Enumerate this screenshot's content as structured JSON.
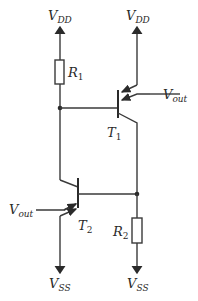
{
  "diagram": {
    "type": "circuit-schematic",
    "supplies": {
      "vdd_left": {
        "main": "V",
        "sub": "DD"
      },
      "vdd_right": {
        "main": "V",
        "sub": "DD"
      },
      "vss_left": {
        "main": "V",
        "sub": "SS"
      },
      "vss_right": {
        "main": "V",
        "sub": "SS"
      }
    },
    "resistors": [
      {
        "id": "R1",
        "main": "R",
        "sub": "1"
      },
      {
        "id": "R2",
        "main": "R",
        "sub": "2"
      }
    ],
    "transistors": [
      {
        "id": "T1",
        "main": "T",
        "sub": "1",
        "type": "multi-emitter PNP"
      },
      {
        "id": "T2",
        "main": "T",
        "sub": "2",
        "type": "multi-emitter PNP"
      }
    ],
    "outputs": [
      {
        "id": "vout_t1",
        "main": "V",
        "sub": "out"
      },
      {
        "id": "vout_t2",
        "main": "V",
        "sub": "out"
      }
    ],
    "colors": {
      "line": "#3a3a3a",
      "text": "#2a2a2a",
      "background": "#ffffff"
    }
  }
}
